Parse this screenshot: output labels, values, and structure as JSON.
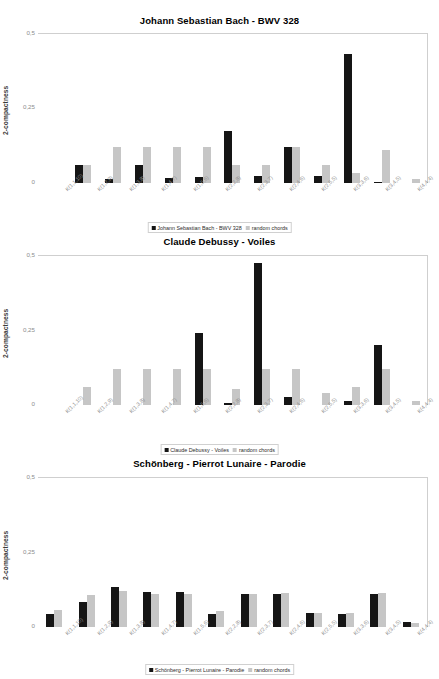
{
  "colors": {
    "series_dark": "#151515",
    "series_light": "#c6c6c6",
    "axis": "#b9b9b9",
    "tick_text": "#8f8f8f",
    "background": "#ffffff"
  },
  "common": {
    "ylabel": "2-compactness",
    "yticks": [
      "0,5",
      "0,25",
      "0"
    ],
    "ylim": [
      0,
      0.5
    ],
    "categories": [
      "K(1,1,10)",
      "K(1,2,9)",
      "K(1,3,8)",
      "K(1,4,7)",
      "K(1,5,6)",
      "K(2,2,8)",
      "K(2,3,7)",
      "K(2,4,6)",
      "K(2,5,5)",
      "K(3,3,6)",
      "K(3,4,5)",
      "K(4,4,4)"
    ],
    "random_label": "random chords"
  },
  "panels": [
    {
      "title": "Johann Sebastian Bach - BWV 328",
      "legend": [
        "Johann Sebastian Bach - BWV 328",
        "random chords"
      ]
    },
    {
      "title": "Claude Debussy - Voiles",
      "legend": [
        "Claude Debussy - Voiles",
        "random chords"
      ]
    },
    {
      "title": "Schönberg - Pierrot Lunaire - Parodie",
      "legend": [
        "Schönberg - Pierrot Lunaire - Parodie",
        "random chords"
      ]
    }
  ],
  "chart_data": [
    {
      "type": "bar",
      "title": "Johann Sebastian Bach - BWV 328",
      "xlabel": "",
      "ylabel": "2-compactness",
      "ylim": [
        0,
        0.5
      ],
      "yticks": [
        0,
        0.25,
        0.5
      ],
      "grid": false,
      "legend_position": "bottom",
      "categories": [
        "K(1,1,10)",
        "K(1,2,9)",
        "K(1,3,8)",
        "K(1,4,7)",
        "K(1,5,6)",
        "K(2,2,8)",
        "K(2,3,7)",
        "K(2,4,6)",
        "K(2,5,5)",
        "K(3,3,6)",
        "K(3,4,5)",
        "K(4,4,4)"
      ],
      "series": [
        {
          "name": "Johann Sebastian Bach - BWV 328",
          "color": "#151515",
          "values": [
            0.0,
            0.06,
            0.012,
            0.06,
            0.017,
            0.019,
            0.175,
            0.025,
            0.12,
            0.023,
            0.432,
            0.004
          ]
        },
        {
          "name": "random chords",
          "color": "#c6c6c6",
          "values": [
            0.0,
            0.06,
            0.12,
            0.12,
            0.12,
            0.12,
            0.06,
            0.06,
            0.12,
            0.06,
            0.035,
            0.11,
            0.013
          ]
        }
      ]
    },
    {
      "type": "bar",
      "title": "Claude Debussy - Voiles",
      "xlabel": "",
      "ylabel": "2-compactness",
      "ylim": [
        0,
        0.5
      ],
      "yticks": [
        0,
        0.25,
        0.5
      ],
      "grid": false,
      "legend_position": "bottom",
      "categories": [
        "K(1,1,10)",
        "K(1,2,9)",
        "K(1,3,8)",
        "K(1,4,7)",
        "K(1,5,6)",
        "K(2,2,8)",
        "K(2,3,7)",
        "K(2,4,6)",
        "K(2,5,5)",
        "K(3,3,6)",
        "K(3,4,5)",
        "K(4,4,4)"
      ],
      "series": [
        {
          "name": "Claude Debussy - Voiles",
          "color": "#151515",
          "values": [
            0.0,
            0.0,
            0.0,
            0.0,
            0.0,
            0.24,
            0.008,
            0.478,
            0.028,
            0.0,
            0.012,
            0.2,
            0.0
          ]
        },
        {
          "name": "random chords",
          "color": "#c6c6c6",
          "values": [
            0.0,
            0.06,
            0.12,
            0.12,
            0.12,
            0.12,
            0.055,
            0.12,
            0.12,
            0.04,
            0.06,
            0.12,
            0.012
          ]
        }
      ]
    },
    {
      "type": "bar",
      "title": "Schönberg - Pierrot Lunaire - Parodie",
      "xlabel": "",
      "ylabel": "2-compactness",
      "ylim": [
        0,
        0.5
      ],
      "yticks": [
        0,
        0.25,
        0.5
      ],
      "grid": false,
      "legend_position": "bottom",
      "categories": [
        "K(1,1,10)",
        "K(1,2,9)",
        "K(1,3,8)",
        "K(1,4,7)",
        "K(1,5,6)",
        "K(2,2,8)",
        "K(2,3,7)",
        "K(2,4,6)",
        "K(2,5,5)",
        "K(3,3,6)",
        "K(3,4,5)",
        "K(4,4,4)"
      ],
      "series": [
        {
          "name": "Schönberg - Pierrot Lunaire - Parodie",
          "color": "#151515",
          "values": [
            0.042,
            0.085,
            0.135,
            0.118,
            0.118,
            0.043,
            0.112,
            0.112,
            0.047,
            0.042,
            0.112,
            0.018
          ]
        },
        {
          "name": "random chords",
          "color": "#c6c6c6",
          "values": [
            0.056,
            0.108,
            0.122,
            0.112,
            0.112,
            0.053,
            0.112,
            0.115,
            0.047,
            0.047,
            0.115,
            0.013
          ]
        }
      ]
    }
  ]
}
